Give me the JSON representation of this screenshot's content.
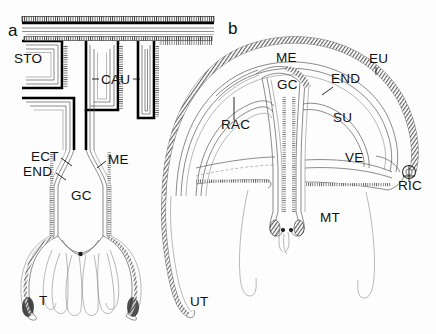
{
  "figure": {
    "background_color": "#fdfdfd",
    "ink_color": "#111111",
    "width": 436,
    "height": 334
  },
  "panels": [
    {
      "id": "a",
      "letter": "a",
      "letter_pos": {
        "x": 8,
        "y": 36
      },
      "labels": [
        {
          "key": "sto",
          "text": "STO",
          "x": 14,
          "y": 63,
          "leader": null
        },
        {
          "key": "cau",
          "text": "CAU",
          "x": 101,
          "y": 84,
          "leader": "both-sides"
        },
        {
          "key": "ect",
          "text": "ECT",
          "x": 31,
          "y": 161,
          "leader": "right-down"
        },
        {
          "key": "end",
          "text": "END",
          "x": 23,
          "y": 176,
          "leader": "right-down"
        },
        {
          "key": "me",
          "text": "ME",
          "x": 108,
          "y": 164,
          "leader": "left-down"
        },
        {
          "key": "gc",
          "text": "GC",
          "x": 71,
          "y": 200,
          "leader": null
        },
        {
          "key": "t",
          "text": "T",
          "x": 39,
          "y": 305,
          "leader": null
        }
      ]
    },
    {
      "id": "b",
      "letter": "b",
      "letter_pos": {
        "x": 228,
        "y": 34
      },
      "labels": [
        {
          "key": "me",
          "text": "ME",
          "x": 276,
          "y": 62,
          "leader": null
        },
        {
          "key": "eu",
          "text": "EU",
          "x": 369,
          "y": 63,
          "leader": "down"
        },
        {
          "key": "end",
          "text": "END",
          "x": 331,
          "y": 83,
          "leader": "left-down"
        },
        {
          "key": "gc",
          "text": "GC",
          "x": 277,
          "y": 89,
          "leader": null
        },
        {
          "key": "su",
          "text": "SU",
          "x": 333,
          "y": 122,
          "leader": null
        },
        {
          "key": "rac",
          "text": "RAC",
          "x": 221,
          "y": 129,
          "leader": "up"
        },
        {
          "key": "ve",
          "text": "VE",
          "x": 345,
          "y": 162,
          "leader": null
        },
        {
          "key": "ric",
          "text": "RIC",
          "x": 398,
          "y": 190,
          "leader": "up"
        },
        {
          "key": "mt",
          "text": "MT",
          "x": 320,
          "y": 222,
          "leader": null
        },
        {
          "key": "ut",
          "text": "UT",
          "x": 190,
          "y": 306,
          "leader": null
        }
      ]
    }
  ],
  "legend_keys": {
    "STO": "stomodeum",
    "CAU": "caulis",
    "ECT": "ectoderm",
    "END": "endoderm",
    "ME": "mesogloea",
    "GC": "gastric cavity",
    "T": "tentacle",
    "UT": "umbrellar tentacle",
    "EU": "exumbrella",
    "SU": "subumbrella",
    "RAC": "radial canal",
    "VE": "velum",
    "RIC": "ring canal",
    "MT": "manubrial tentacle"
  }
}
